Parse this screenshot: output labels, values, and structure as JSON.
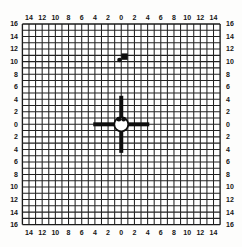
{
  "colors": {
    "grid_line": "#222222",
    "border_line": "#1a1a1a",
    "mark_black": "#0e0e0e",
    "circle_fill": "#ffffff",
    "background": "#fdfdfc",
    "label_color": "#151515"
  },
  "chart_data": {
    "type": "scatter",
    "title": "",
    "xlabel": "",
    "ylabel": "",
    "grid": true,
    "x_range": [
      -15,
      15
    ],
    "y_range": [
      -16,
      16
    ],
    "grid_step_units": 1,
    "label_step_units": 2,
    "x_tick_values": [
      -14,
      -12,
      -10,
      -8,
      -6,
      -4,
      -2,
      0,
      2,
      4,
      6,
      8,
      10,
      12,
      14
    ],
    "x_tick_labels": [
      "14",
      "12",
      "10",
      "8",
      "6",
      "4",
      "2",
      "0",
      "2",
      "4",
      "6",
      "8",
      "10",
      "12",
      "14"
    ],
    "y_tick_values": [
      16,
      14,
      12,
      10,
      8,
      6,
      4,
      2,
      0,
      -2,
      -4,
      -6,
      -8,
      -10,
      -12,
      -14,
      -16
    ],
    "y_tick_labels": [
      "16",
      "14",
      "12",
      "10",
      "8",
      "6",
      "4",
      "2",
      "0",
      "2",
      "4",
      "6",
      "8",
      "10",
      "12",
      "14",
      "16"
    ],
    "tick_label_sides": [
      "top",
      "bottom",
      "left",
      "right"
    ],
    "crosshair": {
      "center_x": 0,
      "center_y": 0,
      "bar_half_length_vertical_units": 4.55,
      "bar_half_length_horizontal_units": 4.25,
      "bar_width_px": 4,
      "circle_radius_px": 7,
      "circle_stroke_px": 1.8,
      "inner_dots": [
        {
          "x": -0.36,
          "y": 0.82
        },
        {
          "x": 0.36,
          "y": 0.82
        }
      ],
      "inner_dot_radius_px": 2.4
    },
    "impact_marks": [
      {
        "shape": "square",
        "x": 0.5,
        "y": 10.8,
        "size_px": 6.4
      },
      {
        "shape": "dot",
        "x": -0.27,
        "y": 10.25,
        "radius_px": 2.3
      }
    ]
  }
}
